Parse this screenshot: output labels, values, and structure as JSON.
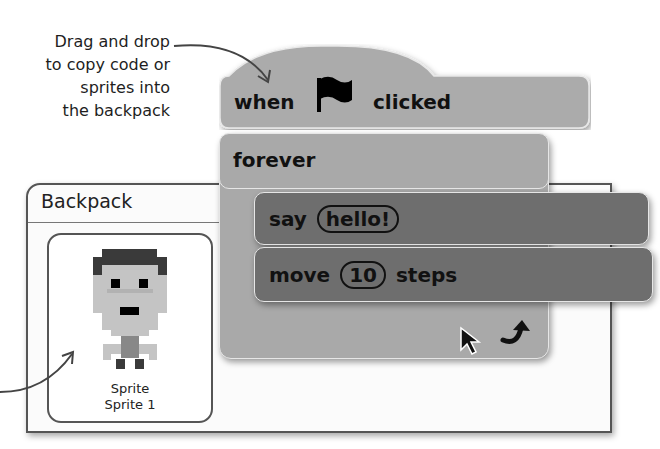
{
  "annotation": {
    "caption_lines": [
      "Drag and drop",
      "to copy code or",
      "sprites into",
      "the backpack"
    ]
  },
  "backpack": {
    "title": "Backpack",
    "items": [
      {
        "type": "Sprite",
        "name": "Sprite 1"
      }
    ]
  },
  "script": {
    "hat_block": {
      "word_before": "when",
      "icon": "green-flag-icon",
      "word_after": "clicked"
    },
    "forever_block": {
      "label": "forever",
      "loop_icon": "loop-arrow-icon"
    },
    "say_block": {
      "label": "say",
      "value": "hello!"
    },
    "move_block": {
      "label": "move",
      "value": "10",
      "suffix": "steps"
    }
  },
  "colors": {
    "control_block": "#a9a9a9",
    "looks_motion_block": "#6e6e6e",
    "text": "#111111"
  }
}
